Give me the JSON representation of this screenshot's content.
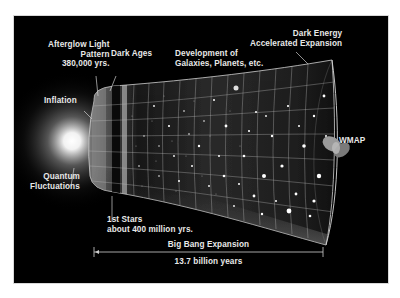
{
  "diagram": {
    "labels": {
      "afterglow": [
        "Afterglow Light",
        "Pattern",
        "380,000 yrs."
      ],
      "dark_ages": "Dark Ages",
      "development": [
        "Development of",
        "Galaxies, Planets, etc."
      ],
      "dark_energy": [
        "Dark Energy",
        "Accelerated Expansion"
      ],
      "inflation": "Inflation",
      "quantum": [
        "Quantum",
        "Fluctuations"
      ],
      "first_stars": [
        "1st Stars",
        "about 400 million yrs."
      ],
      "wmap": "WMAP",
      "expansion": "Big Bang Expansion",
      "duration": "13.7 billion years"
    },
    "colors": {
      "background": "#000000",
      "page": "#ffffff",
      "text": "#e8e8e8",
      "grid": "#bfbfbf",
      "glow": "#ffffff"
    }
  }
}
